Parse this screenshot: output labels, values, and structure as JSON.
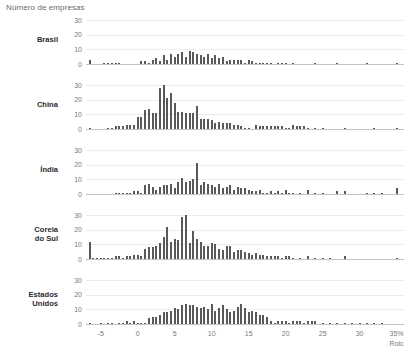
{
  "chart_data": {
    "type": "bar",
    "title": "Número de empresas",
    "xlabel": "Roic",
    "ylabel": "Número de empresas",
    "grid": true,
    "legend": "none",
    "xlim": [
      -7,
      36
    ],
    "ylim": [
      0,
      33
    ],
    "yticks": [
      0,
      10,
      20,
      30
    ],
    "ytick_labels": [
      "0",
      "10",
      "20",
      "30"
    ],
    "xticks": [
      -5,
      0,
      5,
      10,
      15,
      20,
      25,
      30,
      35
    ],
    "xtick_labels": [
      "-5",
      "0",
      "5",
      "10",
      "15",
      "20",
      "25",
      "30",
      "35%"
    ],
    "bin_width": 0.5,
    "panels": [
      {
        "label": "Brasil",
        "x": [
          -6.5,
          -6,
          -5.5,
          -5,
          -4.5,
          -4,
          -3.5,
          -3,
          -2.5,
          -2,
          -1.5,
          -1,
          -0.5,
          0,
          0.5,
          1,
          1.5,
          2,
          2.5,
          3,
          3.5,
          4,
          4.5,
          5,
          5.5,
          6,
          6.5,
          7,
          7.5,
          8,
          8.5,
          9,
          9.5,
          10,
          10.5,
          11,
          11.5,
          12,
          12.5,
          13,
          13.5,
          14,
          14.5,
          15,
          15.5,
          16,
          16.5,
          17,
          17.5,
          18,
          18.5,
          19,
          19.5,
          20,
          20.5,
          21,
          22,
          23,
          24,
          25,
          26,
          27,
          28,
          29,
          30,
          31,
          32,
          33,
          34,
          35
        ],
        "values": [
          3,
          0,
          0,
          0,
          1,
          1,
          1,
          1,
          1,
          0,
          0,
          0,
          0,
          0,
          2,
          2,
          1,
          3,
          4,
          2,
          6,
          3,
          7,
          5,
          7,
          8,
          5,
          9,
          8,
          7,
          6,
          5,
          7,
          4,
          6,
          4,
          5,
          2,
          3,
          3,
          3,
          3,
          1,
          3,
          2,
          1,
          1,
          1,
          1,
          1,
          0,
          1,
          1,
          1,
          0,
          1,
          0,
          0,
          1,
          0,
          0,
          1,
          0,
          0,
          0,
          1,
          0,
          0,
          0,
          1
        ]
      },
      {
        "label": "China",
        "x": [
          -6.5,
          -6,
          -5.5,
          -5,
          -4.5,
          -4,
          -3.5,
          -3,
          -2.5,
          -2,
          -1.5,
          -1,
          -0.5,
          0,
          0.5,
          1,
          1.5,
          2,
          2.5,
          3,
          3.5,
          4,
          4.5,
          5,
          5.5,
          6,
          6.5,
          7,
          7.5,
          8,
          8.5,
          9,
          9.5,
          10,
          10.5,
          11,
          11.5,
          12,
          12.5,
          13,
          13.5,
          14,
          14.5,
          15,
          15.5,
          16,
          16.5,
          17,
          17.5,
          18,
          18.5,
          19,
          19.5,
          20,
          20.5,
          21,
          21.5,
          22,
          22.5,
          23,
          24,
          25,
          26,
          27,
          28,
          29,
          30,
          31,
          32,
          33,
          34,
          35
        ],
        "values": [
          1,
          0,
          0,
          0,
          0,
          1,
          1,
          2,
          2,
          2,
          3,
          3,
          3,
          8,
          8,
          13,
          14,
          11,
          11,
          28,
          30,
          21,
          25,
          18,
          12,
          12,
          11,
          11,
          11,
          16,
          7,
          7,
          7,
          6,
          4,
          5,
          4,
          4,
          4,
          3,
          3,
          2,
          1,
          1,
          0,
          3,
          2,
          2,
          2,
          2,
          2,
          2,
          2,
          1,
          1,
          3,
          2,
          2,
          2,
          1,
          1,
          1,
          0,
          0,
          1,
          0,
          0,
          0,
          1,
          0,
          0,
          1
        ]
      },
      {
        "label": "Índia",
        "x": [
          -6.5,
          -6,
          -5.5,
          -5,
          -4.5,
          -4,
          -3.5,
          -3,
          -2.5,
          -2,
          -1.5,
          -1,
          -0.5,
          0,
          0.5,
          1,
          1.5,
          2,
          2.5,
          3,
          3.5,
          4,
          4.5,
          5,
          5.5,
          6,
          6.5,
          7,
          7.5,
          8,
          8.5,
          9,
          9.5,
          10,
          10.5,
          11,
          11.5,
          12,
          12.5,
          13,
          13.5,
          14,
          14.5,
          15,
          15.5,
          16,
          16.5,
          17,
          17.5,
          18,
          18.5,
          19,
          19.5,
          20,
          20.5,
          21,
          22,
          23,
          24,
          25,
          26,
          27,
          28,
          29,
          30,
          31,
          32,
          33,
          34,
          35
        ],
        "values": [
          0,
          0,
          0,
          0,
          0,
          0,
          0,
          1,
          1,
          1,
          1,
          1,
          2,
          2,
          1,
          6,
          7,
          5,
          3,
          5,
          6,
          6,
          7,
          4,
          8,
          11,
          8,
          9,
          10,
          21,
          6,
          8,
          7,
          6,
          5,
          7,
          4,
          5,
          6,
          3,
          5,
          4,
          4,
          3,
          2,
          2,
          3,
          1,
          1,
          2,
          1,
          2,
          1,
          3,
          1,
          1,
          1,
          3,
          1,
          1,
          0,
          2,
          2,
          0,
          0,
          1,
          1,
          1,
          0,
          4
        ]
      },
      {
        "label": "Coreia\ndo Sul",
        "x": [
          -6.5,
          -6,
          -5.5,
          -5,
          -4.5,
          -4,
          -3.5,
          -3,
          -2.5,
          -2,
          -1.5,
          -1,
          -0.5,
          0,
          0.5,
          1,
          1.5,
          2,
          2.5,
          3,
          3.5,
          4,
          4.5,
          5,
          5.5,
          6,
          6.5,
          7,
          7.5,
          8,
          8.5,
          9,
          9.5,
          10,
          10.5,
          11,
          11.5,
          12,
          12.5,
          13,
          13.5,
          14,
          14.5,
          15,
          15.5,
          16,
          16.5,
          17,
          17.5,
          18,
          18.5,
          19,
          19.5,
          20,
          20.5,
          21,
          22,
          23,
          24,
          25,
          26,
          28,
          30,
          32,
          34,
          35
        ],
        "values": [
          12,
          1,
          1,
          1,
          1,
          1,
          1,
          2,
          2,
          1,
          2,
          2,
          3,
          3,
          2,
          7,
          8,
          8,
          9,
          11,
          15,
          22,
          12,
          14,
          13,
          29,
          30,
          11,
          19,
          14,
          12,
          9,
          9,
          11,
          10,
          7,
          6,
          9,
          9,
          5,
          6,
          6,
          5,
          4,
          3,
          4,
          3,
          3,
          2,
          2,
          2,
          2,
          1,
          2,
          2,
          1,
          1,
          2,
          1,
          1,
          1,
          2,
          0,
          0,
          0,
          1
        ]
      },
      {
        "label": "Estados\nUnidos",
        "x": [
          -6.5,
          -6,
          -5.5,
          -5,
          -4.5,
          -4,
          -3.5,
          -3,
          -2.5,
          -2,
          -1.5,
          -1,
          -0.5,
          0,
          0.5,
          1,
          1.5,
          2,
          2.5,
          3,
          3.5,
          4,
          4.5,
          5,
          5.5,
          6,
          6.5,
          7,
          7.5,
          8,
          8.5,
          9,
          9.5,
          10,
          10.5,
          11,
          11.5,
          12,
          12.5,
          13,
          13.5,
          14,
          14.5,
          15,
          15.5,
          16,
          16.5,
          17,
          17.5,
          18,
          18.5,
          19,
          19.5,
          20,
          20.5,
          21,
          21.5,
          22,
          22.5,
          23,
          23.5,
          24,
          25,
          26,
          27,
          28,
          29,
          30,
          31,
          32,
          33,
          34,
          35
        ],
        "values": [
          1,
          0,
          0,
          1,
          0,
          1,
          1,
          0,
          1,
          1,
          2,
          1,
          2,
          1,
          1,
          1,
          4,
          5,
          5,
          6,
          8,
          8,
          9,
          11,
          10,
          13,
          14,
          13,
          13,
          12,
          11,
          12,
          10,
          14,
          9,
          11,
          13,
          10,
          8,
          9,
          12,
          14,
          11,
          8,
          9,
          8,
          6,
          6,
          5,
          2,
          1,
          2,
          2,
          2,
          1,
          2,
          2,
          2,
          1,
          2,
          2,
          2,
          1,
          1,
          1,
          1,
          1,
          1,
          1,
          1,
          1,
          0,
          0,
          13
        ]
      }
    ]
  }
}
